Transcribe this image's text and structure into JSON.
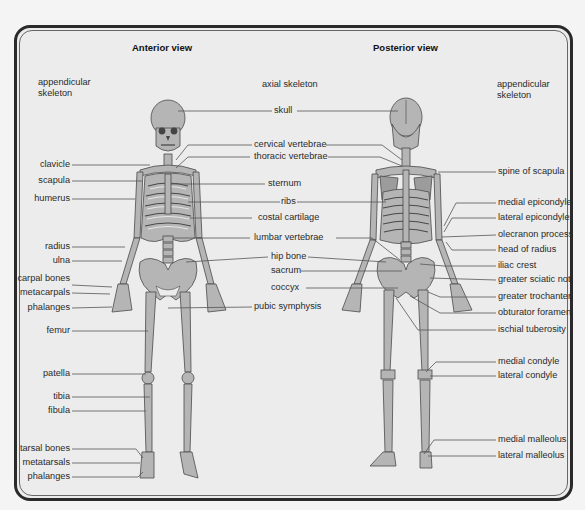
{
  "headers": {
    "anterior": "Anterior view",
    "posterior": "Posterior view"
  },
  "groups": {
    "appendicular_left": [
      "appendicular",
      "skeleton"
    ],
    "axial": "axial skeleton",
    "appendicular_right": [
      "appendicular",
      "skeleton"
    ]
  },
  "left_labels": {
    "clavicle": "clavicle",
    "scapula": "scapula",
    "humerus": "humerus",
    "radius": "radius",
    "ulna": "ulna",
    "carpal_bones": "carpal bones",
    "metacarpals": "metacarpals",
    "phalanges_hand": "phalanges",
    "femur": "femur",
    "patella": "patella",
    "tibia": "tibia",
    "fibula": "fibula",
    "tarsal_bones": "tarsal bones",
    "metatarsals": "metatarsals",
    "phalanges_foot": "phalanges"
  },
  "center_labels": {
    "skull": "skull",
    "cervical_vertebrae": "cervical vertebrae",
    "thoracic_vertebrae": "thoracic vertebrae",
    "sternum": "sternum",
    "ribs": "ribs",
    "costal_cartilage": "costal cartilage",
    "lumbar_vertebrae": "lumbar vertebrae",
    "hip_bone": "hip bone",
    "sacrum": "sacrum",
    "coccyx": "coccyx",
    "pubic_symphysis": "pubic symphysis"
  },
  "right_labels": {
    "spine_of_scapula": "spine of scapula",
    "medial_epicondyle": "medial epicondyle",
    "lateral_epicondyle": "lateral epicondyle",
    "olecranon_process": "olecranon process",
    "head_of_radius": "head of radius",
    "iliac_crest": "iliac crest",
    "greater_sciatic_notch": "greater sciatic notch",
    "greater_trochanter": "greater trochanter",
    "obturator_foramen": "obturator foramen",
    "ischial_tuberosity": "ischial tuberosity",
    "medial_condyle": "medial condyle",
    "lateral_condyle": "lateral condyle",
    "medial_malleolus": "medial malleolus",
    "lateral_malleolus": "lateral malleolus"
  },
  "colors": {
    "bone": "#b3b3b3",
    "bone_outline": "#555555",
    "leader_line": "#555555",
    "frame": "#2a2a2a",
    "panel": "#ececec"
  }
}
